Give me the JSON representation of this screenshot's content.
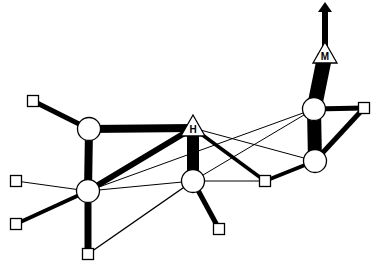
{
  "diagram": {
    "type": "network",
    "colors": {
      "stroke": "#000000",
      "fill": "#ffffff"
    },
    "nodes": [
      {
        "id": "sq_tl",
        "shape": "square",
        "x": 33,
        "y": 101
      },
      {
        "id": "c_a",
        "shape": "circle",
        "x": 89,
        "y": 129
      },
      {
        "id": "H",
        "shape": "triangle",
        "x": 193,
        "y": 128,
        "label": "H"
      },
      {
        "id": "c_b",
        "shape": "circle",
        "x": 88,
        "y": 191
      },
      {
        "id": "c_c",
        "shape": "circle",
        "x": 193,
        "y": 181
      },
      {
        "id": "sq_l",
        "shape": "square",
        "x": 16,
        "y": 181
      },
      {
        "id": "sq_ll",
        "shape": "square",
        "x": 16,
        "y": 224
      },
      {
        "id": "sq_b",
        "shape": "square",
        "x": 88,
        "y": 254
      },
      {
        "id": "sq_bm",
        "shape": "square",
        "x": 219,
        "y": 229
      },
      {
        "id": "sq_mr",
        "shape": "square",
        "x": 265,
        "y": 181
      },
      {
        "id": "c_d",
        "shape": "circle",
        "x": 314,
        "y": 109
      },
      {
        "id": "c_e",
        "shape": "circle",
        "x": 315,
        "y": 161
      },
      {
        "id": "sq_r",
        "shape": "square",
        "x": 364,
        "y": 108
      },
      {
        "id": "M",
        "shape": "triangle",
        "x": 325,
        "y": 55,
        "label": "M"
      }
    ],
    "edges": [
      {
        "from": "sq_tl",
        "to": "c_a",
        "width": 5
      },
      {
        "from": "c_a",
        "to": "H",
        "width": 8
      },
      {
        "from": "c_a",
        "to": "c_b",
        "width": 8
      },
      {
        "from": "c_b",
        "to": "H",
        "width": 6
      },
      {
        "from": "H",
        "to": "c_c",
        "width": 12
      },
      {
        "from": "c_b",
        "to": "sq_l",
        "width": 1
      },
      {
        "from": "c_b",
        "to": "sq_ll",
        "width": 4
      },
      {
        "from": "c_b",
        "to": "sq_b",
        "width": 7
      },
      {
        "from": "sq_b",
        "to": "c_c",
        "width": 1.5
      },
      {
        "from": "c_b",
        "to": "c_c",
        "width": 1
      },
      {
        "from": "c_b",
        "to": "c_d",
        "width": 1
      },
      {
        "from": "c_c",
        "to": "c_d",
        "width": 1
      },
      {
        "from": "H",
        "to": "c_e",
        "width": 1
      },
      {
        "from": "H",
        "to": "sq_mr",
        "width": 3.5
      },
      {
        "from": "c_c",
        "to": "sq_mr",
        "width": 1
      },
      {
        "from": "c_c",
        "to": "sq_bm",
        "width": 5
      },
      {
        "from": "sq_mr",
        "to": "c_e",
        "width": 4
      },
      {
        "from": "c_d",
        "to": "c_e",
        "width": 14
      },
      {
        "from": "c_d",
        "to": "sq_r",
        "width": 5
      },
      {
        "from": "sq_r",
        "to": "c_e",
        "width": 5
      },
      {
        "from": "c_d",
        "to": "M",
        "width": 15
      },
      {
        "from": "M",
        "to": "arrow_top",
        "width": 6,
        "arrow": true
      }
    ],
    "arrow_tip": {
      "x": 325,
      "y": 2
    }
  }
}
